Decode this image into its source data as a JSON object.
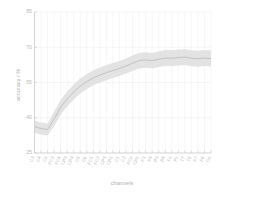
{
  "chart_data": {
    "type": "line",
    "title": "",
    "subtitle": "",
    "xlabel": "channels",
    "ylabel": "accuracy / %",
    "ylim": [
      25,
      85
    ],
    "yticks": [
      25,
      40,
      55,
      70,
      85
    ],
    "ytick_labels": [
      "25",
      "40",
      "55",
      "70",
      "85"
    ],
    "grid": true,
    "legend": null,
    "legend_position": "none",
    "band_label": "confidence interval",
    "categories": [
      "C3",
      "C4",
      "Cz",
      "FC3",
      "FC4",
      "CP3",
      "CP4",
      "C5",
      "C6",
      "FC1",
      "FC2",
      "CP1",
      "CP2",
      "C1",
      "C2",
      "FCz",
      "CPz",
      "F3",
      "F4",
      "P3",
      "P4",
      "Fz",
      "Pz",
      "T7",
      "T8",
      "F7",
      "F8",
      "Oz"
    ],
    "series": [
      {
        "name": "mean accuracy",
        "values": [
          36.2,
          35.4,
          35.0,
          39.5,
          44.5,
          48.0,
          51.0,
          53.5,
          55.4,
          57.0,
          58.2,
          59.2,
          60.1,
          61.0,
          62.0,
          63.2,
          64.3,
          64.6,
          64.3,
          64.9,
          65.4,
          65.3,
          65.6,
          65.8,
          65.3,
          65.1,
          65.4,
          65.2
        ]
      }
    ],
    "band_upper": [
      38.8,
      38.0,
      37.6,
      42.6,
      47.6,
      51.2,
      54.2,
      56.7,
      58.6,
      60.2,
      61.4,
      62.4,
      63.3,
      64.2,
      65.2,
      66.5,
      67.6,
      67.9,
      67.6,
      68.2,
      68.8,
      68.7,
      69.0,
      69.2,
      68.7,
      68.5,
      68.8,
      68.6
    ],
    "band_lower": [
      33.6,
      32.8,
      32.4,
      36.4,
      41.4,
      44.8,
      47.8,
      50.3,
      52.2,
      53.8,
      55.0,
      56.0,
      56.9,
      57.8,
      58.8,
      59.9,
      61.0,
      61.3,
      61.0,
      61.6,
      62.0,
      61.9,
      62.2,
      62.4,
      61.9,
      61.7,
      62.0,
      61.8
    ]
  },
  "figure": {
    "background_color": "#ffffff",
    "band_color": "#dedede",
    "line_color": "#b4b4b4",
    "axis_color": "#c9c9c9",
    "grid_color": "#ececec",
    "text_color": "#b5b5b5"
  }
}
